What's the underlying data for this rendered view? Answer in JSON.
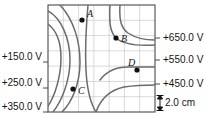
{
  "figure": {
    "type": "contour-map",
    "caption_visible": false,
    "width": 205,
    "height": 126
  },
  "chart_data": {
    "type": "line",
    "title": "",
    "xlabel": "",
    "ylabel": "",
    "grid": true,
    "grid_columns": 7,
    "grid_rows": 7,
    "grid_cell_size_cm": 2.0,
    "plot_box": {
      "x": 48,
      "y": 5,
      "width": 107,
      "height": 107
    },
    "colors": {
      "contour": "#6b6b6b",
      "grid": "#c9c9cf",
      "border": "#4a4a4a",
      "point": "#111111",
      "text": "#141414"
    },
    "left_labels": [
      {
        "text": "+150.0 V",
        "y": 62
      },
      {
        "text": "+250.0 V",
        "y": 88
      },
      {
        "text": "+350.0 V",
        "y": 112
      }
    ],
    "right_labels": [
      {
        "text": "+650.0 V",
        "y": 38
      },
      {
        "text": "+550.0 V",
        "y": 60
      },
      {
        "text": "+450.0 V",
        "y": 84
      }
    ],
    "scale_bar": {
      "label": "2.0 cm",
      "value": 2.0,
      "units": "cm"
    },
    "points": [
      {
        "label": "A",
        "x": 82,
        "y": 20,
        "label_dx": 5,
        "label_dy": -11
      },
      {
        "label": "B",
        "x": 116,
        "y": 38,
        "label_dx": 5,
        "label_dy": -4
      },
      {
        "label": "C",
        "x": 73,
        "y": 89,
        "label_dx": 5,
        "label_dy": -3
      },
      {
        "label": "D",
        "x": 137,
        "y": 70,
        "label_dx": -9,
        "label_dy": -12
      }
    ],
    "contours": [
      {
        "name": "left-150",
        "d": "M 48 24 C 56 30 61 42 61 58 C 61 76 55 96 48 106"
      },
      {
        "name": "left-250",
        "d": "M 48 11 C 61 18 70 38 70 60 C 70 82 61 102 53 112"
      },
      {
        "name": "left-350",
        "d": "M 60 5 C 74 20 80 42 80 62 C 80 84 72 102 62 112"
      },
      {
        "name": "mid-steep",
        "d": "M 88 5 C 86 28 85 50 86 70 C 87 90 91 104 96 112"
      },
      {
        "name": "right-650",
        "d": "M 110 5 C 109 22 110 32 116 38 C 124 45 138 46 155 45"
      },
      {
        "name": "right-550",
        "d": "M 120 5 C 119 20 121 28 128 33 C 137 39 146 40 155 40"
      },
      {
        "name": "right-450",
        "d": "M 100 80 C 106 72 116 67 128 67 C 140 67 149 67 155 67"
      },
      {
        "name": "right-350",
        "d": "M 96 112 C 101 98 110 90 124 87 C 138 85 148 85 155 85"
      }
    ]
  }
}
